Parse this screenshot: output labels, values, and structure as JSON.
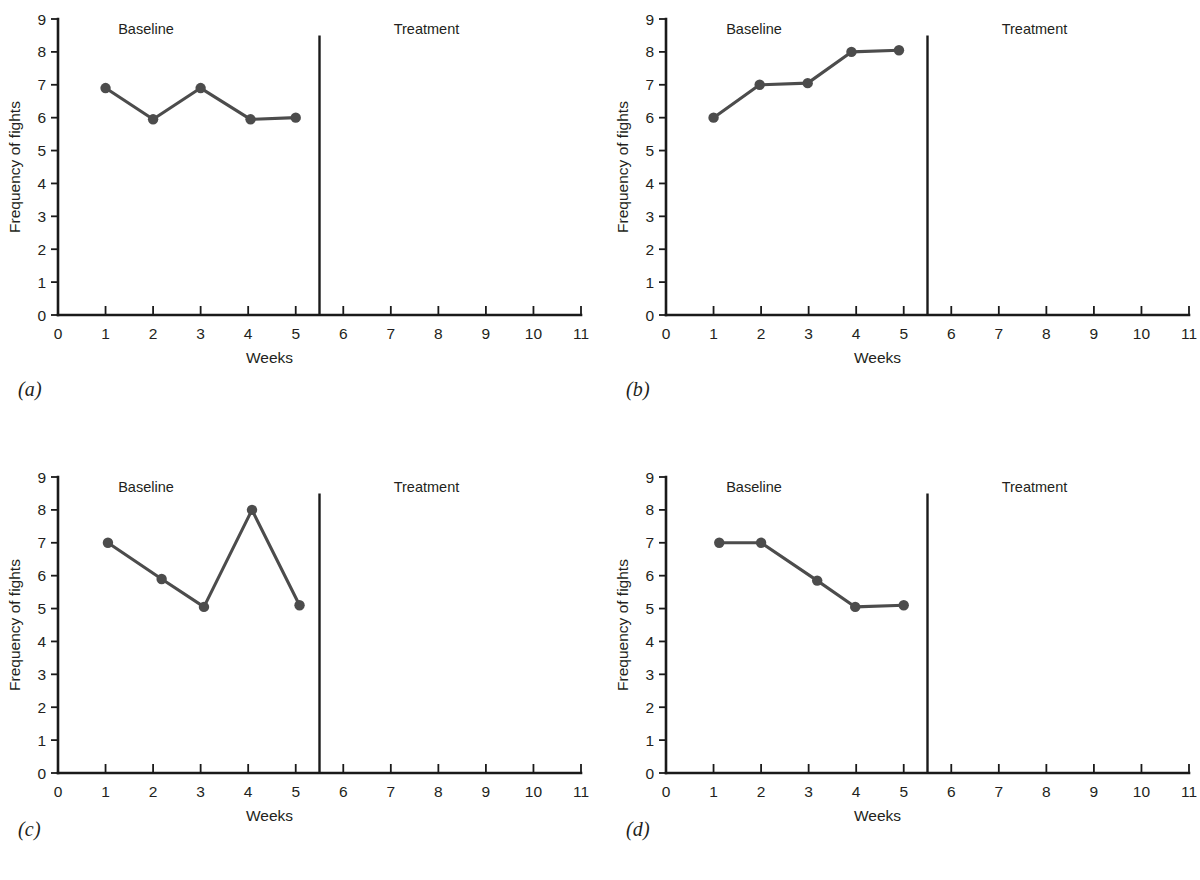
{
  "figure": {
    "background_color": "#ffffff",
    "series_color": "#4c4c4c",
    "axis_color": "#1a1a1a",
    "text_color": "#231f20"
  },
  "panels": [
    {
      "caption": "(a)",
      "chart_data": {
        "type": "line",
        "title": "",
        "xlabel": "Weeks",
        "ylabel": "Frequency of fights",
        "xlim": [
          0,
          11
        ],
        "ylim": [
          0,
          9
        ],
        "xticks": [
          0,
          1,
          2,
          3,
          4,
          5,
          6,
          7,
          8,
          9,
          10,
          11
        ],
        "xticklabels": [
          "0",
          "1",
          "2",
          "3",
          "4",
          "5",
          "6",
          "7",
          "8",
          "9",
          "10",
          "11"
        ],
        "yticks": [
          0,
          1,
          2,
          3,
          4,
          5,
          6,
          7,
          8,
          9
        ],
        "yticklabels": [
          "0",
          "1",
          "2",
          "3",
          "4",
          "5",
          "6",
          "7",
          "8",
          "9"
        ],
        "grid": false,
        "legend": "none",
        "phase_line_x": 5.5,
        "phase_line_top": 8.5,
        "annotations": [
          {
            "text": "Baseline",
            "x": 1.85,
            "y": 8.55
          },
          {
            "text": "Treatment",
            "x": 7.75,
            "y": 8.55
          }
        ],
        "series": [
          {
            "name": "Frequency of fights",
            "phase": "Baseline",
            "x": [
              1.0,
              2.0,
              3.0,
              4.05,
              5.0
            ],
            "values": [
              6.9,
              5.95,
              6.9,
              5.95,
              6.0
            ]
          }
        ]
      }
    },
    {
      "caption": "(b)",
      "chart_data": {
        "type": "line",
        "title": "",
        "xlabel": "Weeks",
        "ylabel": "Frequency of fights",
        "xlim": [
          0,
          11
        ],
        "ylim": [
          0,
          9
        ],
        "xticks": [
          0,
          1,
          2,
          3,
          4,
          5,
          6,
          7,
          8,
          9,
          10,
          11
        ],
        "xticklabels": [
          "0",
          "1",
          "2",
          "3",
          "4",
          "5",
          "6",
          "7",
          "8",
          "9",
          "10",
          "11"
        ],
        "yticks": [
          0,
          1,
          2,
          3,
          4,
          5,
          6,
          7,
          8,
          9
        ],
        "yticklabels": [
          "0",
          "1",
          "2",
          "3",
          "4",
          "5",
          "6",
          "7",
          "8",
          "9"
        ],
        "grid": false,
        "legend": "none",
        "phase_line_x": 5.5,
        "phase_line_top": 8.5,
        "annotations": [
          {
            "text": "Baseline",
            "x": 1.85,
            "y": 8.55
          },
          {
            "text": "Treatment",
            "x": 7.75,
            "y": 8.55
          }
        ],
        "series": [
          {
            "name": "Frequency of fights",
            "phase": "Baseline",
            "x": [
              1.0,
              1.97,
              2.98,
              3.9,
              4.9
            ],
            "values": [
              6.0,
              7.0,
              7.05,
              8.0,
              8.05
            ]
          }
        ]
      }
    },
    {
      "caption": "(c)",
      "chart_data": {
        "type": "line",
        "title": "",
        "xlabel": "Weeks",
        "ylabel": "Frequency of fights",
        "xlim": [
          0,
          11
        ],
        "ylim": [
          0,
          9
        ],
        "xticks": [
          0,
          1,
          2,
          3,
          4,
          5,
          6,
          7,
          8,
          9,
          10,
          11
        ],
        "xticklabels": [
          "0",
          "1",
          "2",
          "3",
          "4",
          "5",
          "6",
          "7",
          "8",
          "9",
          "10",
          "11"
        ],
        "yticks": [
          0,
          1,
          2,
          3,
          4,
          5,
          6,
          7,
          8,
          9
        ],
        "yticklabels": [
          "0",
          "1",
          "2",
          "3",
          "4",
          "5",
          "6",
          "7",
          "8",
          "9"
        ],
        "grid": false,
        "legend": "none",
        "phase_line_x": 5.5,
        "phase_line_top": 8.5,
        "annotations": [
          {
            "text": "Baseline",
            "x": 1.85,
            "y": 8.55
          },
          {
            "text": "Treatment",
            "x": 7.75,
            "y": 8.55
          }
        ],
        "series": [
          {
            "name": "Frequency of fights",
            "phase": "Baseline",
            "x": [
              1.05,
              2.18,
              3.07,
              4.08,
              5.08
            ],
            "values": [
              7.0,
              5.9,
              5.05,
              8.0,
              5.1
            ]
          }
        ]
      }
    },
    {
      "caption": "(d)",
      "chart_data": {
        "type": "line",
        "title": "",
        "xlabel": "Weeks",
        "ylabel": "Frequency of fights",
        "xlim": [
          0,
          11
        ],
        "ylim": [
          0,
          9
        ],
        "xticks": [
          0,
          1,
          2,
          3,
          4,
          5,
          6,
          7,
          8,
          9,
          10,
          11
        ],
        "xticklabels": [
          "0",
          "1",
          "2",
          "3",
          "4",
          "5",
          "6",
          "7",
          "8",
          "9",
          "10",
          "11"
        ],
        "yticks": [
          0,
          1,
          2,
          3,
          4,
          5,
          6,
          7,
          8,
          9
        ],
        "yticklabels": [
          "0",
          "1",
          "2",
          "3",
          "4",
          "5",
          "6",
          "7",
          "8",
          "9"
        ],
        "grid": false,
        "legend": "none",
        "phase_line_x": 5.5,
        "phase_line_top": 8.5,
        "annotations": [
          {
            "text": "Baseline",
            "x": 1.85,
            "y": 8.55
          },
          {
            "text": "Treatment",
            "x": 7.75,
            "y": 8.55
          }
        ],
        "series": [
          {
            "name": "Frequency of fights",
            "phase": "Baseline",
            "x": [
              1.12,
              2.0,
              3.18,
              3.98,
              5.0
            ],
            "values": [
              7.0,
              7.0,
              5.85,
              5.05,
              5.1
            ]
          }
        ]
      }
    }
  ]
}
